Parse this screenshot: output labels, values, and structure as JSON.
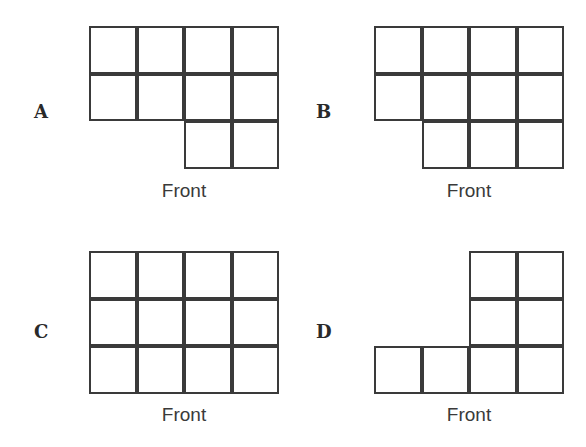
{
  "options": [
    {
      "label": "A",
      "caption": "Front",
      "rows": [
        [
          1,
          1,
          1,
          1
        ],
        [
          1,
          1,
          1,
          1
        ],
        [
          0,
          0,
          1,
          1
        ]
      ]
    },
    {
      "label": "B",
      "caption": "Front",
      "rows": [
        [
          1,
          1,
          1,
          1
        ],
        [
          1,
          1,
          1,
          1
        ],
        [
          0,
          1,
          1,
          1
        ]
      ]
    },
    {
      "label": "C",
      "caption": "Front",
      "rows": [
        [
          1,
          1,
          1,
          1
        ],
        [
          1,
          1,
          1,
          1
        ],
        [
          1,
          1,
          1,
          1
        ]
      ]
    },
    {
      "label": "D",
      "caption": "Front",
      "rows": [
        [
          0,
          0,
          1,
          1
        ],
        [
          0,
          0,
          1,
          1
        ],
        [
          1,
          1,
          1,
          1
        ]
      ]
    }
  ],
  "colors": {
    "line": "#3a3a3a",
    "background": "#ffffff"
  }
}
